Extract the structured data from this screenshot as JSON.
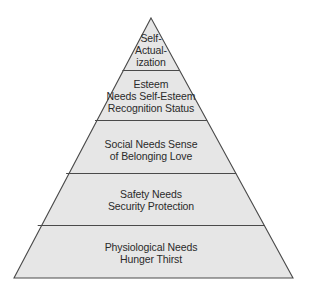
{
  "diagram": {
    "type": "pyramid",
    "colors": {
      "fill": "#e6e6e6",
      "stroke": "#4a4a4a",
      "text": "#2a2a2a"
    },
    "tiers": [
      {
        "level": 5,
        "name": "Self-Actualization",
        "label": "Self-\nActual-\nization"
      },
      {
        "level": 4,
        "name": "Esteem",
        "label": "Esteem\nNeeds Self-Esteem\nRecognition Status"
      },
      {
        "level": 3,
        "name": "Social",
        "label": "Social Needs Sense\nof Belonging Love"
      },
      {
        "level": 2,
        "name": "Safety",
        "label": "Safety Needs\nSecurity Protection"
      },
      {
        "level": 1,
        "name": "Physiological",
        "label": "Physiological Needs\nHunger Thirst"
      }
    ]
  }
}
